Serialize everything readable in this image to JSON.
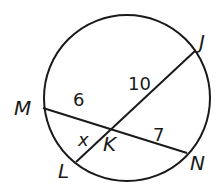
{
  "diagram": {
    "type": "circle-intersecting-chords",
    "circle": {
      "cx": 127,
      "cy": 98,
      "r": 83
    },
    "points": {
      "M": {
        "label": "M",
        "x": 43,
        "y": 108
      },
      "J": {
        "label": "J",
        "x": 195,
        "y": 51
      },
      "N": {
        "label": "N",
        "x": 187,
        "y": 153
      },
      "L": {
        "label": "L",
        "x": 76,
        "y": 162
      },
      "K": {
        "label": "K",
        "x": 110,
        "y": 128
      }
    },
    "chords": [
      {
        "from": "M",
        "to": "N"
      },
      {
        "from": "L",
        "to": "J"
      }
    ],
    "segment_labels": {
      "MK": "6",
      "KJ": "10",
      "KN": "7",
      "LK": "x"
    },
    "stroke_color": "#1a1a1a"
  }
}
